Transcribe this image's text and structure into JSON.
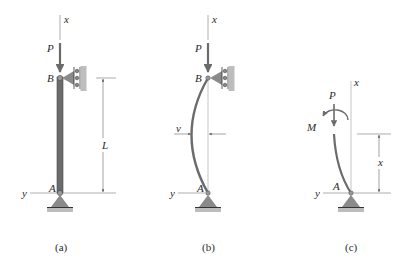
{
  "figure": {
    "panels": [
      {
        "id": "a",
        "caption": "(a)",
        "description": "Straight pin-supported column of length L under axial load P",
        "labels": {
          "axis_x": "x",
          "axis_y": "y",
          "load": "P",
          "top_support": "B",
          "bottom_support": "A",
          "length": "L"
        }
      },
      {
        "id": "b",
        "caption": "(b)",
        "description": "Buckled column with lateral deflection v",
        "labels": {
          "axis_x": "x",
          "axis_y": "y",
          "load": "P",
          "top_support": "B",
          "bottom_support": "A",
          "deflection": "v"
        }
      },
      {
        "id": "c",
        "caption": "(c)",
        "description": "Free-body diagram of segment of length x with internal moment M",
        "labels": {
          "axis_x": "x",
          "axis_y": "y",
          "load": "P",
          "moment": "M",
          "bottom_support": "A",
          "segment_length": "x"
        }
      }
    ],
    "colors": {
      "member": "#6b6b6b",
      "member_edge": "#4a4a4a",
      "support_fill": "#8a8a8a",
      "line": "#555555",
      "text": "#2a2a2a"
    }
  }
}
